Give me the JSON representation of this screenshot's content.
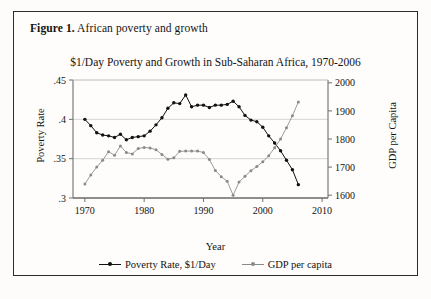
{
  "figure": {
    "caption_label": "Figure 1.",
    "caption_text": " African poverty and growth"
  },
  "chart_data": {
    "type": "line",
    "title": "$1/Day Poverty and Growth in Sub-Saharan Africa, 1970-2006",
    "xlabel": "Year",
    "ylabel": "Poverty Rate",
    "ylabel_right": "GDP per Capita",
    "xlim": [
      1968,
      2011
    ],
    "ylim": [
      0.3,
      0.45
    ],
    "ylim_right": [
      1590,
      2010
    ],
    "xticks": [
      1970,
      1980,
      1990,
      2000,
      2010
    ],
    "xtick_labels": [
      "1970",
      "1980",
      "1990",
      "2000",
      "2010"
    ],
    "yticks": [
      0.3,
      0.35,
      0.4,
      0.45
    ],
    "ytick_labels": [
      ".3",
      ".35",
      ".4",
      ".45"
    ],
    "yticks_right": [
      1600,
      1700,
      1800,
      1900,
      2000
    ],
    "ytick_labels_right": [
      "1600",
      "1700",
      "1800",
      "1900",
      "2000"
    ],
    "grid": true,
    "legend_position": "bottom",
    "x": [
      1970,
      1971,
      1972,
      1973,
      1974,
      1975,
      1976,
      1977,
      1978,
      1979,
      1980,
      1981,
      1982,
      1983,
      1984,
      1985,
      1986,
      1987,
      1988,
      1989,
      1990,
      1991,
      1992,
      1993,
      1994,
      1995,
      1996,
      1997,
      1998,
      1999,
      2000,
      2001,
      2002,
      2003,
      2004,
      2005,
      2006
    ],
    "series": [
      {
        "name": "Poverty Rate, $1/Day",
        "axis": "left",
        "color": "#111111",
        "values": [
          0.4,
          0.392,
          0.383,
          0.38,
          0.379,
          0.377,
          0.381,
          0.374,
          0.377,
          0.378,
          0.379,
          0.385,
          0.393,
          0.402,
          0.414,
          0.421,
          0.42,
          0.431,
          0.416,
          0.418,
          0.418,
          0.415,
          0.418,
          0.418,
          0.419,
          0.423,
          0.416,
          0.405,
          0.399,
          0.397,
          0.39,
          0.379,
          0.37,
          0.36,
          0.348,
          0.336,
          0.317
        ]
      },
      {
        "name": "GDP per capita",
        "axis": "right",
        "color": "#8a8a8a",
        "values": [
          1640,
          1672,
          1700,
          1724,
          1755,
          1742,
          1775,
          1752,
          1747,
          1766,
          1770,
          1768,
          1762,
          1745,
          1728,
          1733,
          1756,
          1757,
          1757,
          1757,
          1752,
          1727,
          1688,
          1666,
          1650,
          1600,
          1647,
          1667,
          1687,
          1702,
          1719,
          1740,
          1769,
          1800,
          1840,
          1883,
          1932
        ]
      }
    ]
  },
  "legend": {
    "entries": [
      {
        "label": "Poverty Rate, $1/Day",
        "color": "#111111"
      },
      {
        "label": "GDP per capita",
        "color": "#8a8a8a"
      }
    ]
  }
}
